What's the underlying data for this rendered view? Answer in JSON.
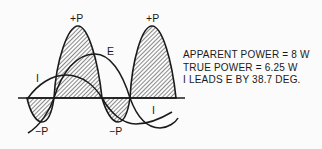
{
  "diagram": {
    "labels": {
      "plus_p_1": "+P",
      "plus_p_2": "+P",
      "minus_p_1": "−P",
      "minus_p_2": "−P",
      "e_curve": "E",
      "i_curve_1": "I",
      "i_curve_2": "I"
    },
    "info": {
      "apparent_power": "APPARENT POWER = 8 W",
      "true_power": "TRUE POWER = 6.25 W",
      "phase": "I LEADS E BY 38.7 DEG."
    },
    "colors": {
      "line": "#1a1a1a",
      "background": "#fbfbfb"
    }
  }
}
